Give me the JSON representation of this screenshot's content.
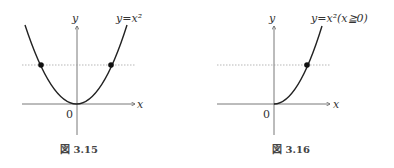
{
  "figures": [
    {
      "id": "fig-3-15",
      "caption": "図 3.15",
      "equation": "y=x²",
      "x_axis_label": "x",
      "y_axis_label": "y",
      "origin_label": "0",
      "curve": "full parabola",
      "marked_points": 2
    },
    {
      "id": "fig-3-16",
      "caption": "図 3.16",
      "equation": "y=x²(x≧0)",
      "x_axis_label": "x",
      "y_axis_label": "y",
      "origin_label": "0",
      "curve": "right half parabola",
      "marked_points": 1
    }
  ],
  "colors": {
    "curve": "#222222",
    "axis": "#555555",
    "dotted": "#999999"
  }
}
